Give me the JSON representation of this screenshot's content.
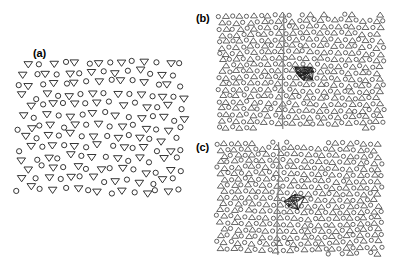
{
  "figure": {
    "type": "scientific-figure",
    "caption_labels": [
      "(a)",
      "(b)",
      "(c)"
    ],
    "background_color": "#ffffff",
    "marker_stroke_color": "#2b2b2b",
    "bond_color": "#1a1a1a",
    "grain_boundary_color": "#808080",
    "width": 395,
    "height": 268
  },
  "panels": [
    {
      "id": "a",
      "label": "(a)",
      "label_x": 33,
      "label_y": 48,
      "x": 14,
      "y": 58,
      "width": 174,
      "height": 140,
      "description": "disordered binary particle configuration",
      "marker_types": [
        "circle",
        "triangle-down"
      ],
      "marker_radius": 2.6,
      "has_grain_boundary": false,
      "has_defect_cluster": false,
      "lattice": {
        "style": "amorphous",
        "rows": 13,
        "row_spacing": 10.6,
        "col_spacing": 11.6,
        "jitter": 2.6
      }
    },
    {
      "id": "b",
      "label": "(b)",
      "label_x": 196,
      "label_y": 13,
      "x": 216,
      "y": 12,
      "width": 170,
      "height": 118,
      "description": "crystalline binary lattice with vertical grain boundary and central defect cluster",
      "marker_types": [
        "circle",
        "triangle-up"
      ],
      "marker_radius": 2.1,
      "has_grain_boundary": true,
      "grain_boundary_x": 283,
      "grain_boundary_y1": 14,
      "grain_boundary_y2": 129,
      "has_defect_cluster": true,
      "cluster_center_x": 306,
      "cluster_center_y": 73,
      "cluster_width": 34,
      "cluster_height": 20,
      "cluster_node_count": 9,
      "lattice": {
        "style": "hexagonal",
        "rows": 19,
        "row_spacing": 6.3,
        "col_spacing": 7.0,
        "jitter": 0.85
      }
    },
    {
      "id": "c",
      "label": "(c)",
      "label_x": 196,
      "label_y": 142,
      "x": 214,
      "y": 140,
      "width": 170,
      "height": 116,
      "description": "crystalline binary lattice with vertical grain boundary and compact defect cluster",
      "marker_types": [
        "circle",
        "triangle-up"
      ],
      "marker_radius": 2.1,
      "has_grain_boundary": true,
      "grain_boundary_x": 278,
      "grain_boundary_y1": 142,
      "grain_boundary_y2": 255,
      "has_defect_cluster": true,
      "cluster_center_x": 294,
      "cluster_center_y": 201,
      "cluster_width": 28,
      "cluster_height": 18,
      "cluster_node_count": 7,
      "lattice": {
        "style": "hexagonal",
        "rows": 19,
        "row_spacing": 6.2,
        "col_spacing": 7.0,
        "jitter": 0.8
      }
    }
  ],
  "chart_data": {
    "type": "scatter",
    "title": "",
    "xlabel": "",
    "ylabel": "",
    "legend": [],
    "grid": false,
    "subplots": [
      {
        "name": "(a)",
        "description": "Disordered (liquid-like) binary particle configuration. Open circles represent species A, open down-pointing triangles represent species B.",
        "species": [
          {
            "name": "species-A",
            "marker": "circle",
            "approx_count": 82
          },
          {
            "name": "species-B",
            "marker": "triangle-down",
            "approx_count": 82
          }
        ],
        "total_particles": 164,
        "xlim": [
          0,
          174
        ],
        "ylim": [
          0,
          140
        ]
      },
      {
        "name": "(b)",
        "description": "Ordered binary crystal with a vertical grain boundary (gray line) and a highlighted defect cluster drawn with bond network lines.",
        "species": [
          {
            "name": "species-A",
            "marker": "circle",
            "approx_count": 230
          },
          {
            "name": "species-B",
            "marker": "triangle-up",
            "approx_count": 230
          }
        ],
        "total_particles": 460,
        "annotations": [
          {
            "kind": "grain-boundary",
            "orientation": "vertical",
            "x": 0.4
          },
          {
            "kind": "defect-cluster",
            "x": 0.53,
            "y": 0.52,
            "bonds": 18
          }
        ],
        "xlim": [
          0,
          170
        ],
        "ylim": [
          0,
          118
        ]
      },
      {
        "name": "(c)",
        "description": "Ordered binary crystal with a vertical grain boundary (gray line) and a compact defect cluster drawn with bond network lines.",
        "species": [
          {
            "name": "species-A",
            "marker": "circle",
            "approx_count": 230
          },
          {
            "name": "species-B",
            "marker": "triangle-up",
            "approx_count": 230
          }
        ],
        "total_particles": 460,
        "annotations": [
          {
            "kind": "grain-boundary",
            "orientation": "vertical",
            "x": 0.38
          },
          {
            "kind": "defect-cluster",
            "x": 0.47,
            "y": 0.53,
            "bonds": 13
          }
        ],
        "xlim": [
          0,
          170
        ],
        "ylim": [
          0,
          116
        ]
      }
    ]
  }
}
